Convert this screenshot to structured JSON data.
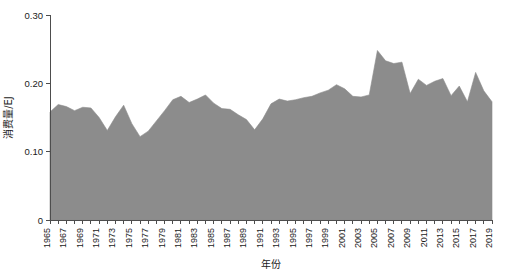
{
  "chart_data": {
    "type": "area",
    "title": "",
    "xlabel": "年份",
    "ylabel": "消费量/EJ",
    "xlim": [
      1965,
      2019
    ],
    "ylim": [
      0,
      0.3
    ],
    "grid": false,
    "legend": null,
    "series_color": "#8c8c8c",
    "series": [
      {
        "name": "消费量",
        "x": [
          1965,
          1966,
          1967,
          1968,
          1969,
          1970,
          1971,
          1972,
          1973,
          1974,
          1975,
          1976,
          1977,
          1978,
          1979,
          1980,
          1981,
          1982,
          1983,
          1984,
          1985,
          1986,
          1987,
          1988,
          1989,
          1990,
          1991,
          1992,
          1993,
          1994,
          1995,
          1996,
          1997,
          1998,
          1999,
          2000,
          2001,
          2002,
          2003,
          2004,
          2005,
          2006,
          2007,
          2008,
          2009,
          2010,
          2011,
          2012,
          2013,
          2014,
          2015,
          2016,
          2017,
          2018,
          2019
        ],
        "values": [
          0.158,
          0.169,
          0.166,
          0.16,
          0.165,
          0.164,
          0.15,
          0.131,
          0.151,
          0.168,
          0.141,
          0.122,
          0.13,
          0.145,
          0.16,
          0.176,
          0.181,
          0.172,
          0.177,
          0.183,
          0.171,
          0.163,
          0.162,
          0.154,
          0.147,
          0.132,
          0.148,
          0.17,
          0.177,
          0.174,
          0.176,
          0.179,
          0.181,
          0.186,
          0.19,
          0.198,
          0.192,
          0.181,
          0.18,
          0.183,
          0.248,
          0.233,
          0.229,
          0.231,
          0.185,
          0.206,
          0.197,
          0.203,
          0.207,
          0.182,
          0.196,
          0.173,
          0.216,
          0.189,
          0.173
        ]
      }
    ],
    "y_ticks": [
      {
        "value": 0,
        "label": "0"
      },
      {
        "value": 0.1,
        "label": "0.10"
      },
      {
        "value": 0.2,
        "label": "0.20"
      },
      {
        "value": 0.3,
        "label": "0.30"
      }
    ],
    "x_ticks_labeled": [
      "1965",
      "1967",
      "1969",
      "1971",
      "1973",
      "1975",
      "1977",
      "1979",
      "1981",
      "1983",
      "1985",
      "1987",
      "1989",
      "1991",
      "1993",
      "1995",
      "1997",
      "1999",
      "2001",
      "2003",
      "2005",
      "2007",
      "2009",
      "2011",
      "2013",
      "2015",
      "2017",
      "2019"
    ]
  }
}
